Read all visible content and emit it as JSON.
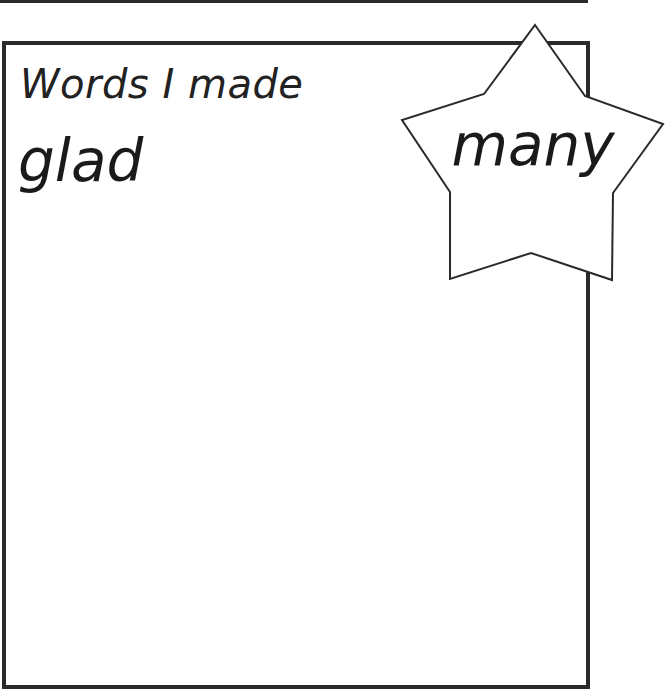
{
  "worksheet": {
    "heading": "Words I made",
    "made_words": [
      "glad"
    ],
    "star_word": "many",
    "colors": {
      "line": "#2a2a2a",
      "text": "#1a1a1a",
      "background": "#ffffff"
    }
  }
}
